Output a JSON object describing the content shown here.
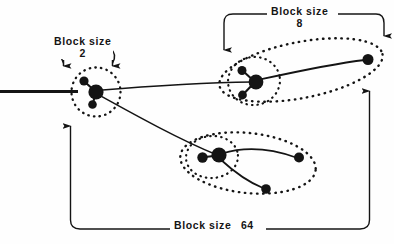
{
  "figure": {
    "background_color": "#fefefe",
    "ink_color": "#141414",
    "width": 394,
    "height": 244
  },
  "labels": {
    "block_size_2": {
      "text": "Block size",
      "value": "2"
    },
    "block_size_8": {
      "text": "Block size",
      "value": "8"
    },
    "block_size_64": {
      "text": "Block size",
      "value": "64"
    }
  },
  "brackets": [
    {
      "name": "bracket-block-size-2",
      "label": "Block size 2",
      "arrow_direction": "down",
      "arrow_count": 2,
      "style": "curved-hooks"
    },
    {
      "name": "bracket-block-size-8",
      "label": "Block size 8",
      "arrow_direction": "down",
      "arrow_count": 2,
      "style": "square-bracket"
    },
    {
      "name": "bracket-block-size-64",
      "label": "Block size 64",
      "arrow_direction": "up",
      "arrow_count": 2,
      "style": "square-bracket"
    }
  ],
  "clusters": [
    {
      "name": "cluster-left",
      "block_size": "2",
      "boundary": "dotted-circle",
      "boundary_count": 1,
      "nodes": 3
    },
    {
      "name": "cluster-upper-right",
      "block_size": "8",
      "boundary": "dotted-ellipse",
      "boundary_count": 2,
      "nodes": 4
    },
    {
      "name": "cluster-lower-middle",
      "block_size": "64",
      "boundary": "dotted-ellipse",
      "boundary_count": 2,
      "nodes": 4
    }
  ]
}
